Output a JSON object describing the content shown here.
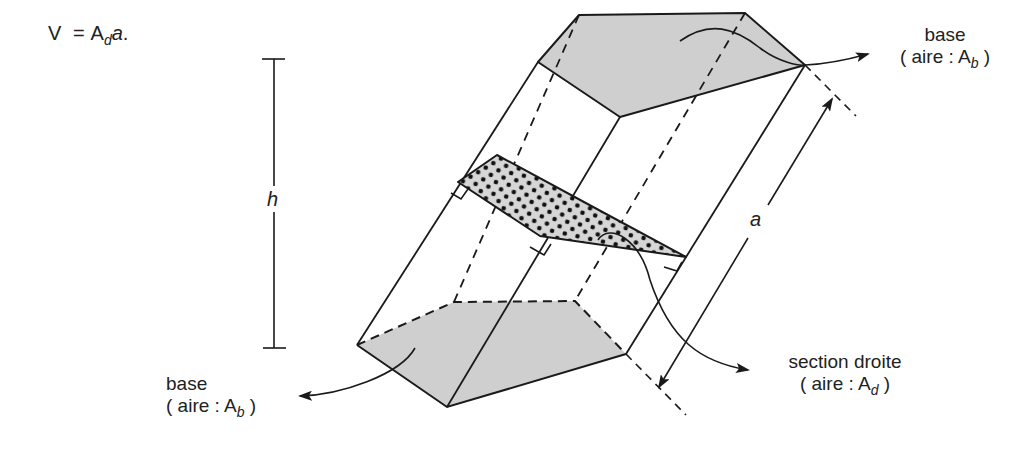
{
  "formula": {
    "lhs": "V",
    "eq": "=",
    "symbol": "A",
    "subscript": "d",
    "var": "a",
    "end": "."
  },
  "labels": {
    "height": "h",
    "edge_length": "a",
    "top_base": {
      "title": "base",
      "area_prefix": "( aire : A",
      "area_sub": "b",
      "area_suffix": " )"
    },
    "bottom_base": {
      "title": "base",
      "area_prefix": "( aire : A",
      "area_sub": "b",
      "area_suffix": " )"
    },
    "section": {
      "title": "section droite",
      "area_prefix": "( aire : A",
      "area_sub": "d",
      "area_suffix": " )"
    }
  },
  "colors": {
    "stroke": "#1a1a1a",
    "base_fill": "#cfcfcf",
    "section_fill": "#d6d6d6",
    "dots": "#111111"
  }
}
